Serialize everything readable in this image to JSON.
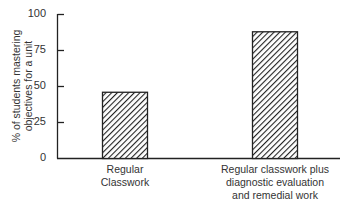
{
  "chart_data": {
    "type": "bar",
    "title": "",
    "xlabel": "",
    "ylabel": "% of students mastering objectives for a unit",
    "ylabel_lines": [
      "% of students mastering",
      "objectives for a unit"
    ],
    "categories": [
      "Regular Classwork",
      "Regular classwork plus diagnostic evaluation and remedial work"
    ],
    "category_lines": [
      [
        "Regular",
        "Classwork"
      ],
      [
        "Regular classwork plus",
        "diagnostic evaluation",
        "and remedial work"
      ]
    ],
    "values": [
      46,
      88
    ],
    "ylim": [
      0,
      100
    ],
    "yticks": [
      0,
      25,
      50,
      75,
      100
    ],
    "grid": false,
    "legend": null,
    "bar_fill": "diagonal-hatch",
    "colors": {
      "bar_stroke": "#222222",
      "hatch": "#222222",
      "axis": "#222222"
    }
  }
}
